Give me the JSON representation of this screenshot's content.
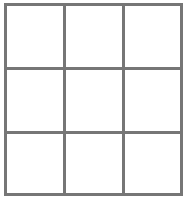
{
  "board": {
    "rows": 3,
    "cols": 3,
    "line_color": "#767676",
    "cells": [
      [
        "",
        "",
        ""
      ],
      [
        "",
        "",
        ""
      ],
      [
        "",
        "",
        ""
      ]
    ]
  }
}
